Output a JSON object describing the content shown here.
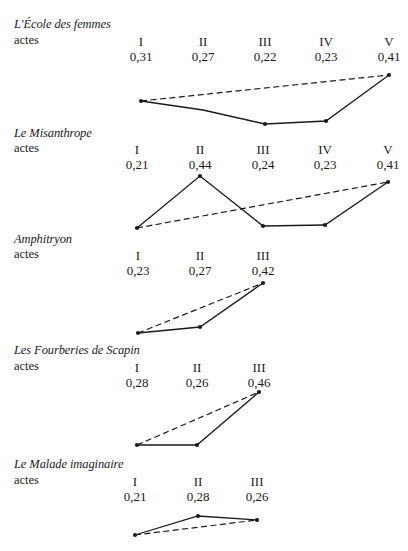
{
  "row_label": "actes",
  "colors": {
    "ink": "#1a1a1a",
    "background": "#ffffff"
  },
  "plays": [
    {
      "title": "L'École des femmes",
      "title_y": 17,
      "label_y": 33,
      "acts": [
        {
          "numeral": "I",
          "value": "0,31",
          "x": 141,
          "y": 101
        },
        {
          "numeral": "II",
          "value": "0,27",
          "x": 203,
          "y": 110
        },
        {
          "numeral": "III",
          "value": "0,22",
          "x": 265,
          "y": 124
        },
        {
          "numeral": "IV",
          "value": "0,23",
          "x": 326,
          "y": 121
        },
        {
          "numeral": "V",
          "value": "0,41",
          "x": 389,
          "y": 75
        }
      ],
      "markers": [
        0,
        2,
        3,
        4
      ]
    },
    {
      "title": "Le Misanthrope",
      "title_y": 126,
      "label_y": 141,
      "acts": [
        {
          "numeral": "I",
          "value": "0,21",
          "x": 137,
          "y": 228
        },
        {
          "numeral": "II",
          "value": "0,44",
          "x": 200,
          "y": 176
        },
        {
          "numeral": "III",
          "value": "0,24",
          "x": 263,
          "y": 226
        },
        {
          "numeral": "IV",
          "value": "0,23",
          "x": 325,
          "y": 225
        },
        {
          "numeral": "V",
          "value": "0,41",
          "x": 388,
          "y": 182
        }
      ],
      "markers": [
        0,
        1,
        2,
        3,
        4
      ]
    },
    {
      "title": "Amphitryon",
      "title_y": 232,
      "label_y": 247,
      "acts": [
        {
          "numeral": "I",
          "value": "0,23",
          "x": 138,
          "y": 333
        },
        {
          "numeral": "II",
          "value": "0,27",
          "x": 200,
          "y": 327
        },
        {
          "numeral": "III",
          "value": "0,42",
          "x": 263,
          "y": 283
        }
      ],
      "markers": [
        0,
        1,
        2
      ]
    },
    {
      "title": "Les Fourberies de Scapin",
      "title_y": 343,
      "label_y": 359,
      "acts": [
        {
          "numeral": "I",
          "value": "0,28",
          "x": 137,
          "y": 445
        },
        {
          "numeral": "II",
          "value": "0,26",
          "x": 197,
          "y": 445
        },
        {
          "numeral": "III",
          "value": "0,46",
          "x": 259,
          "y": 392
        }
      ],
      "markers": [
        0,
        1,
        2
      ]
    },
    {
      "title": "Le Malade imaginaire",
      "title_y": 457,
      "label_y": 473,
      "acts": [
        {
          "numeral": "I",
          "value": "0,21",
          "x": 135,
          "y": 535
        },
        {
          "numeral": "II",
          "value": "0,28",
          "x": 198,
          "y": 516
        },
        {
          "numeral": "III",
          "value": "0,26",
          "x": 257,
          "y": 520
        }
      ],
      "markers": [
        0,
        1,
        2
      ]
    }
  ],
  "chart_data": [
    {
      "type": "line",
      "title": "L'École des femmes",
      "xlabel": "actes",
      "categories": [
        "I",
        "II",
        "III",
        "IV",
        "V"
      ],
      "series": [
        {
          "name": "value per act (solid)",
          "values": [
            0.31,
            0.27,
            0.22,
            0.23,
            0.41
          ]
        },
        {
          "name": "first-to-last reference (dashed)",
          "values": [
            0.31,
            null,
            null,
            null,
            0.41
          ]
        }
      ],
      "grid": false,
      "axes_visible": false
    },
    {
      "type": "line",
      "title": "Le Misanthrope",
      "xlabel": "actes",
      "categories": [
        "I",
        "II",
        "III",
        "IV",
        "V"
      ],
      "series": [
        {
          "name": "value per act (solid)",
          "values": [
            0.21,
            0.44,
            0.24,
            0.23,
            0.41
          ]
        },
        {
          "name": "first-to-last reference (dashed)",
          "values": [
            0.21,
            null,
            null,
            null,
            0.41
          ]
        }
      ],
      "grid": false,
      "axes_visible": false
    },
    {
      "type": "line",
      "title": "Amphitryon",
      "xlabel": "actes",
      "categories": [
        "I",
        "II",
        "III"
      ],
      "series": [
        {
          "name": "value per act (solid)",
          "values": [
            0.23,
            0.27,
            0.42
          ]
        },
        {
          "name": "first-to-last reference (dashed)",
          "values": [
            0.23,
            null,
            0.42
          ]
        }
      ],
      "grid": false,
      "axes_visible": false
    },
    {
      "type": "line",
      "title": "Les Fourberies de Scapin",
      "xlabel": "actes",
      "categories": [
        "I",
        "II",
        "III"
      ],
      "series": [
        {
          "name": "value per act (solid)",
          "values": [
            0.28,
            0.26,
            0.46
          ]
        },
        {
          "name": "first-to-last reference (dashed)",
          "values": [
            0.28,
            null,
            0.46
          ]
        }
      ],
      "grid": false,
      "axes_visible": false
    },
    {
      "type": "line",
      "title": "Le Malade imaginaire",
      "xlabel": "actes",
      "categories": [
        "I",
        "II",
        "III"
      ],
      "series": [
        {
          "name": "value per act (solid)",
          "values": [
            0.21,
            0.28,
            0.26
          ]
        },
        {
          "name": "first-to-last reference (dashed)",
          "values": [
            0.21,
            null,
            0.26
          ]
        }
      ],
      "grid": false,
      "axes_visible": false
    }
  ]
}
